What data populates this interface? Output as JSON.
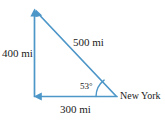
{
  "figure": {
    "kind": "geometry-diagram",
    "shape": "right-triangle",
    "stroke_color": "#4d96c8",
    "text_color": "#1b1b1b",
    "background_color": "#ffffff",
    "labels": {
      "vertical_leg": "400 mi",
      "hypotenuse": "500 mi",
      "horizontal_leg": "300 mi",
      "angle": "53°",
      "vertex_place": "New York"
    },
    "measurements": {
      "vertical_leg_value": 400,
      "hypotenuse_value": 500,
      "horizontal_leg_value": 300,
      "unit": "mi",
      "angle_value": 53,
      "angle_unit": "degrees"
    },
    "vertices": {
      "apex": {
        "x": 35,
        "y": 9
      },
      "corner": {
        "x": 35,
        "y": 97
      },
      "new_york": {
        "x": 117,
        "y": 97
      }
    },
    "arrows": {
      "vertical_leg_head": "up",
      "hypotenuse_head": "up-left",
      "horizontal_leg_head": "left"
    }
  }
}
